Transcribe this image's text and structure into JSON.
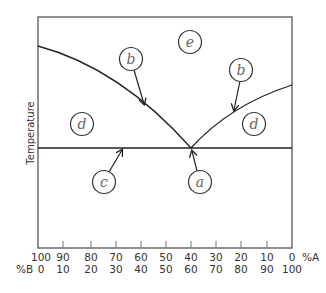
{
  "diagram": {
    "type": "binary eutectic phase diagram",
    "y_axis_label": "Temperature",
    "x_axis": {
      "row_a": {
        "unit_label": "%A",
        "ticks": [
          "100",
          "90",
          "80",
          "70",
          "60",
          "50",
          "40",
          "30",
          "20",
          "10",
          "0"
        ]
      },
      "row_b": {
        "unit_label": "%B",
        "ticks": [
          "0",
          "10",
          "20",
          "30",
          "40",
          "50",
          "60",
          "70",
          "80",
          "90",
          "100"
        ]
      }
    },
    "eutectic": {
      "percent_A": 40,
      "percent_B": 60
    },
    "labels": [
      {
        "id": "d-left",
        "letter": "d",
        "region": "left solid + liquid region"
      },
      {
        "id": "b-left",
        "letter": "b",
        "points_to": "left liquidus curve"
      },
      {
        "id": "e",
        "letter": "e",
        "region": "liquid region"
      },
      {
        "id": "b-right",
        "letter": "b",
        "points_to": "right liquidus curve"
      },
      {
        "id": "d-right",
        "letter": "d",
        "region": "right solid + liquid region"
      },
      {
        "id": "c",
        "letter": "c",
        "points_to": "eutectic line"
      },
      {
        "id": "a",
        "letter": "a",
        "points_to": "eutectic point"
      }
    ],
    "colors": {
      "line": "#222222",
      "frame": "#555555",
      "text": "#333333",
      "letter": "#666666"
    }
  }
}
